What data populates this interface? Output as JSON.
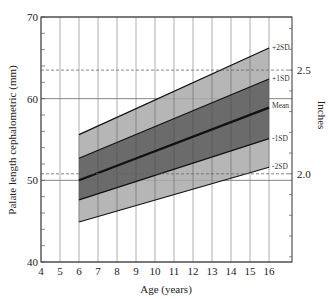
{
  "chart_data": {
    "type": "area",
    "title": "",
    "xlabel": "Age (years)",
    "ylabel": "Palate length cephalometric (mm)",
    "ylabel_right": "Inches",
    "xlim": [
      4,
      16
    ],
    "ylim": [
      40,
      70
    ],
    "x_ticks": [
      "4",
      "5",
      "6",
      "7",
      "8",
      "9",
      "10",
      "11",
      "12",
      "13",
      "14",
      "15",
      "16"
    ],
    "y_ticks": [
      "40",
      "50",
      "60",
      "70"
    ],
    "y_ticks_right": [
      "2.0",
      "2.5"
    ],
    "grid": true,
    "x": [
      6,
      16
    ],
    "series": [
      {
        "name": "+2SD",
        "values": [
          55.6,
          66.2
        ]
      },
      {
        "name": "+1SD",
        "values": [
          52.7,
          62.4
        ]
      },
      {
        "name": "Mean",
        "values": [
          50.0,
          58.9
        ]
      },
      {
        "name": "-1SD",
        "values": [
          47.6,
          55.1
        ]
      },
      {
        "name": "-2SD",
        "values": [
          44.9,
          51.6
        ]
      }
    ],
    "reference_lines": [
      {
        "label": "2.5",
        "unit": "in",
        "value_mm": 63.5,
        "style": "dashed"
      },
      {
        "label": "2.0",
        "unit": "in",
        "value_mm": 50.8,
        "style": "dashed"
      }
    ],
    "colors": {
      "outer_band": "#a9a9a9",
      "inner_band": "#5e5e5e",
      "lines": "#111111",
      "grid": "#9a9a9a"
    }
  }
}
